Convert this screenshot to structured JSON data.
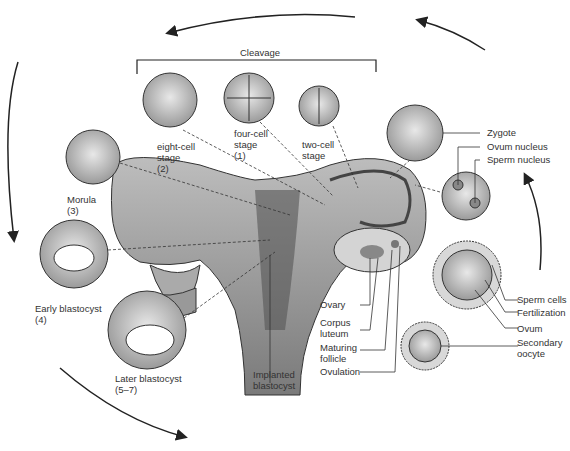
{
  "bracket_label": "Cleavage",
  "stages": [
    {
      "id": "two-cell",
      "label": "two-cell\nstage"
    },
    {
      "id": "four-cell",
      "label": "four-cell\nstage\n(1)"
    },
    {
      "id": "eight-cell",
      "label": "eight-cell\nstage\n(2)"
    },
    {
      "id": "morula",
      "label": "Morula\n(3)"
    },
    {
      "id": "early-blastocyst",
      "label": "Early blastocyst\n(4)"
    },
    {
      "id": "later-blastocyst",
      "label": "Later blastocyst\n(5–7)"
    },
    {
      "id": "implanted",
      "label": "Implanted\nblastocyst"
    }
  ],
  "right_labels": {
    "zygote": "Zygote",
    "ovum_nucleus": "Ovum nucleus",
    "sperm_nucleus": "Sperm nucleus",
    "sperm_cells": "Sperm cells",
    "fertilization": "Fertilization",
    "ovum": "Ovum",
    "secondary_oocyte": "Secondary\noocyte"
  },
  "ovary_labels": {
    "ovary": "Ovary",
    "corpus_luteum": "Corpus\nluteum",
    "maturing_follicle": "Maturing\nfollicle",
    "ovulation": "Ovulation"
  },
  "colors": {
    "ink": "#222222",
    "tissue": "#9a9a9a",
    "cell": "#cfcfcf",
    "text": "#333333"
  }
}
